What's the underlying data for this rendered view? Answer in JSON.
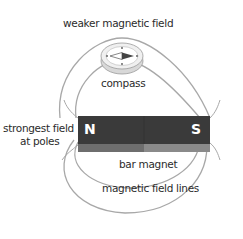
{
  "diagram": {
    "labels": {
      "top": "weaker magnetic field",
      "compass": "compass",
      "left_line1": "strongest field",
      "left_line2": "at poles",
      "magnet": "bar magnet",
      "field_lines": "magnetic field lines"
    },
    "poles": {
      "north": "N",
      "south": "S"
    },
    "colors": {
      "background": "#ffffff",
      "field_line": "#a8a8a8",
      "magnet_top": "#3a3a3a",
      "magnet_front_north": "#6e6e6e",
      "magnet_front_south": "#8a8a8a",
      "compass_body": "#eeeeee",
      "text": "#2b2b2b"
    }
  }
}
